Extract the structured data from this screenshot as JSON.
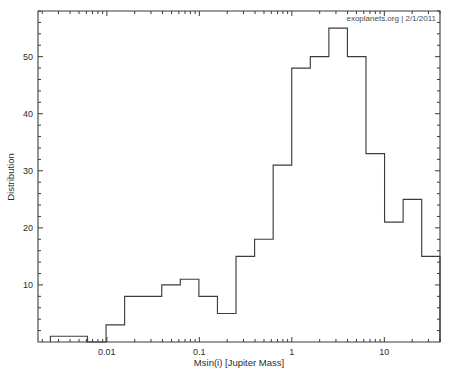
{
  "figure": {
    "credit": "exoplanets.org | 2/1/2011",
    "background_color": "#ffffff",
    "line_color": "#3d3d3d"
  },
  "chart_data": {
    "type": "bar",
    "title": "",
    "subtitle": "",
    "xlabel": "Msin(i) [Jupiter Mass]",
    "ylabel": "Distribution",
    "xscale": "log",
    "yscale": "linear",
    "grid": false,
    "legend": null,
    "xlim": [
      0.0018,
      40
    ],
    "ylim": [
      0,
      58
    ],
    "xticks": [
      0.01,
      0.1,
      1,
      10
    ],
    "xtick_labels": [
      "0.01",
      "0.1",
      "1",
      "10"
    ],
    "yticks": [
      10,
      20,
      30,
      40,
      50
    ],
    "ytick_labels": [
      "10",
      "20",
      "30",
      "40",
      "50"
    ],
    "annotations": [
      {
        "text": "exoplanets.org | 2/1/2011",
        "position": "top-right"
      }
    ],
    "bin_edges": [
      0.00245,
      0.00389,
      0.00617,
      0.0098,
      0.01556,
      0.0247,
      0.03922,
      0.06227,
      0.09886,
      0.15696,
      0.24922,
      0.39567,
      0.62817,
      0.99733,
      1.5834,
      2.51405,
      3.99155,
      6.33639,
      10.06,
      15.9721,
      25.3555,
      40.2545
    ],
    "values": [
      1,
      1,
      0,
      3,
      8,
      8,
      10,
      11,
      8,
      5,
      15,
      18,
      31,
      48,
      50,
      55,
      50,
      33,
      21,
      25,
      15,
      9,
      2
    ],
    "bins": [
      {
        "left": 0.00245,
        "right": 0.00617,
        "count": 1
      },
      {
        "left": 0.00617,
        "right": 0.0098,
        "count": 0
      },
      {
        "left": 0.0098,
        "right": 0.01556,
        "count": 3
      },
      {
        "left": 0.01556,
        "right": 0.0247,
        "count": 8
      },
      {
        "left": 0.0247,
        "right": 0.03922,
        "count": 8
      },
      {
        "left": 0.03922,
        "right": 0.06227,
        "count": 10
      },
      {
        "left": 0.06227,
        "right": 0.09886,
        "count": 11
      },
      {
        "left": 0.09886,
        "right": 0.15696,
        "count": 8
      },
      {
        "left": 0.15696,
        "right": 0.24922,
        "count": 5
      },
      {
        "left": 0.24922,
        "right": 0.39567,
        "count": 15
      },
      {
        "left": 0.39567,
        "right": 0.62817,
        "count": 18
      },
      {
        "left": 0.62817,
        "right": 0.99733,
        "count": 31
      },
      {
        "left": 0.99733,
        "right": 1.5834,
        "count": 48
      },
      {
        "left": 1.5834,
        "right": 2.51405,
        "count": 50
      },
      {
        "left": 2.51405,
        "right": 3.99155,
        "count": 55
      },
      {
        "left": 3.99155,
        "right": 6.33639,
        "count": 50
      },
      {
        "left": 6.33639,
        "right": 10.06,
        "count": 33
      },
      {
        "left": 10.06,
        "right": 15.9721,
        "count": 21
      },
      {
        "left": 15.9721,
        "right": 25.3555,
        "count": 25
      },
      {
        "left": 25.3555,
        "right": 40.2545,
        "count": 15
      },
      {
        "left": 40.2545,
        "right": 63.9,
        "count": 9
      },
      {
        "left": 63.9,
        "right": 101.4,
        "count": 2
      }
    ]
  }
}
